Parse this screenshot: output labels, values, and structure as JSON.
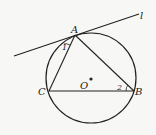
{
  "diagram": {
    "type": "geometry",
    "stroke_color": "#222222",
    "background": "#f7f7f5",
    "circle": {
      "center_label": "O",
      "cx": 91,
      "cy": 78,
      "r": 45
    },
    "points": {
      "A": {
        "label": "A",
        "x": 75,
        "y": 34
      },
      "B": {
        "label": "B",
        "x": 135,
        "y": 91
      },
      "C": {
        "label": "C",
        "x": 48,
        "y": 91
      }
    },
    "line": {
      "label": "l",
      "x1": 14,
      "y1": 56,
      "x2": 139,
      "y2": 14
    },
    "angles": [
      {
        "label": "1",
        "at": "A"
      },
      {
        "label": "2",
        "at": "B"
      }
    ]
  }
}
